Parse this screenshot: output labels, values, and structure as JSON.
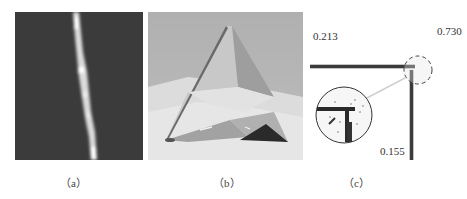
{
  "figure": {
    "panels": [
      {
        "id": "a",
        "caption": "（a）",
        "description": "dark image with bright vertical noisy line"
      },
      {
        "id": "b",
        "caption": "（b）",
        "description": "rendered pyramid on light plane"
      },
      {
        "id": "c",
        "caption": "（c）",
        "description": "L-shaped corner with magnified inset",
        "labels": {
          "top_left": "0.213",
          "top_right": "0.730",
          "bottom": "0.155"
        }
      }
    ]
  }
}
